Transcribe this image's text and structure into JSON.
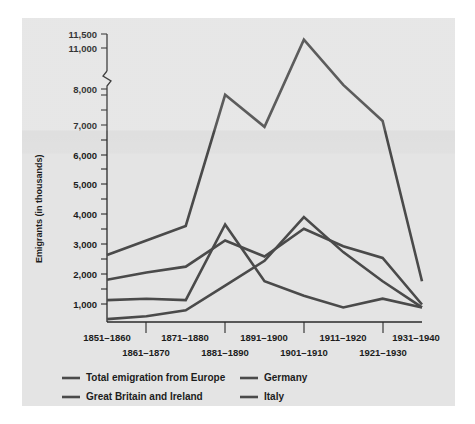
{
  "figure": {
    "background_color": "#e4e4e4",
    "series_color": "#4a4a4a",
    "axis_color": "#2a2a2a"
  },
  "axis": {
    "ylabel": "Emigrants (in thousands)",
    "y_tick_labels": [
      "11,500",
      "11,000",
      "8,000",
      "7,000",
      "6,000",
      "5,000",
      "4,000",
      "3,000",
      "2,000",
      "1,000"
    ],
    "x_tick_labels_upper": [
      "1851–1860",
      "1871–1880",
      "1891–1900",
      "1911–1920",
      "1931–1940"
    ],
    "x_tick_labels_lower": [
      "1861–1870",
      "1881–1890",
      "1901–1910",
      "1921–1930"
    ],
    "axis_break": true
  },
  "legend": {
    "entries": [
      {
        "label": "Total emigration from Europe"
      },
      {
        "label": "Great Britain and Ireland"
      },
      {
        "label": "Germany"
      },
      {
        "label": "Italy"
      }
    ]
  },
  "chart_data": {
    "type": "line",
    "title": "",
    "xlabel": "",
    "ylabel": "Emigrants (in thousands)",
    "grid": false,
    "legend_position": "bottom",
    "axis_break_between": [
      8000,
      11000
    ],
    "ylim": [
      0,
      11500
    ],
    "y_ticks": [
      1000,
      2000,
      3000,
      4000,
      5000,
      6000,
      7000,
      8000,
      11000,
      11500
    ],
    "categories": [
      "1851–1860",
      "1861–1870",
      "1871–1880",
      "1881–1890",
      "1891–1900",
      "1901–1910",
      "1911–1920",
      "1921–1930",
      "1931–1940"
    ],
    "series": [
      {
        "name": "Total emigration from Europe",
        "values": [
          2300,
          2800,
          3300,
          7800,
          6700,
          11300,
          8300,
          6900,
          1400
        ]
      },
      {
        "name": "Great Britain and Ireland",
        "values": [
          1450,
          1700,
          1900,
          2800,
          2250,
          3200,
          2600,
          2200,
          600
        ]
      },
      {
        "name": "Germany",
        "values": [
          750,
          800,
          750,
          3350,
          1400,
          900,
          500,
          800,
          500
        ]
      },
      {
        "name": "Italy",
        "values": [
          100,
          200,
          400,
          1250,
          2100,
          3600,
          2400,
          1400,
          500
        ]
      }
    ]
  }
}
